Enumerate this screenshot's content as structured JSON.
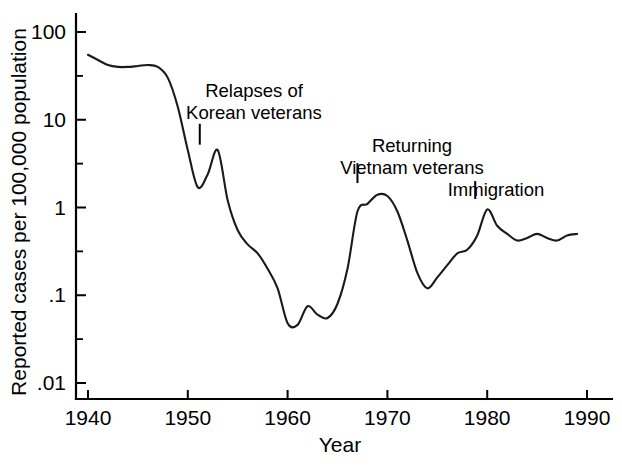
{
  "chart_data": {
    "type": "line",
    "title": "",
    "xlabel": "Year",
    "ylabel": "Reported cases per 100,000 population",
    "xlim": [
      1940,
      1990
    ],
    "ylim": [
      0.01,
      100
    ],
    "yscale": "log",
    "grid": false,
    "legend": "none",
    "xticks": [
      1940,
      1950,
      1960,
      1970,
      1980,
      1990
    ],
    "xtick_labels": [
      "1940",
      "1950",
      "1960",
      "1970",
      "1980",
      "1990"
    ],
    "yticks": [
      100,
      10,
      1,
      0.1,
      0.01
    ],
    "ytick_labels": [
      "100",
      "10",
      "1",
      ".1",
      ".01"
    ],
    "series": [
      {
        "name": "Reported cases per 100,000 population",
        "color": "#1a1a1a",
        "x": [
          1940,
          1941,
          1942,
          1943,
          1944,
          1945,
          1946,
          1947,
          1948,
          1949,
          1950,
          1951,
          1952,
          1953,
          1954,
          1955,
          1956,
          1957,
          1958,
          1959,
          1960,
          1961,
          1962,
          1963,
          1964,
          1965,
          1966,
          1967,
          1968,
          1969,
          1970,
          1971,
          1972,
          1973,
          1974,
          1975,
          1976,
          1977,
          1978,
          1979,
          1980,
          1981,
          1982,
          1983,
          1984,
          1985,
          1986,
          1987,
          1988,
          1989
        ],
        "y": [
          55,
          48,
          42,
          40,
          40,
          41,
          42,
          40,
          30,
          14,
          4.5,
          1.7,
          2.4,
          4.5,
          1.2,
          0.55,
          0.38,
          0.3,
          0.2,
          0.12,
          0.048,
          0.046,
          0.075,
          0.06,
          0.055,
          0.08,
          0.2,
          0.9,
          1.1,
          1.4,
          1.35,
          0.9,
          0.42,
          0.18,
          0.12,
          0.16,
          0.22,
          0.3,
          0.33,
          0.48,
          0.95,
          0.62,
          0.5,
          0.42,
          0.45,
          0.5,
          0.45,
          0.42,
          0.48,
          0.5
        ]
      }
    ],
    "annotations": [
      {
        "id": "relapses-korean-veterans",
        "lines": [
          "Relapses of",
          "Korean veterans"
        ],
        "pointer_year": 1951.2,
        "pointer_top_value": 9.0,
        "pointer_bottom_value": 5.2,
        "text_x": 254,
        "text_y": 97
      },
      {
        "id": "returning-vietnam-veterans",
        "lines": [
          "Returning",
          "Vietnam veterans"
        ],
        "pointer_year": 1967.0,
        "pointer_top_value": 3.2,
        "pointer_bottom_value": 1.9,
        "text_x": 412,
        "text_y": 152
      },
      {
        "id": "immigration",
        "lines": [
          "Immigration"
        ],
        "pointer_year": 1978.8,
        "pointer_top_value": 2.0,
        "pointer_bottom_value": 1.25,
        "text_x": 496,
        "text_y": 196
      }
    ]
  }
}
